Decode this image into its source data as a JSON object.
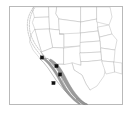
{
  "figure": {
    "name": "species-distribution-map",
    "title": "",
    "caption": "",
    "region_description": "Western United States and Baja California peninsula",
    "background_color": "#ffffff",
    "frame": {
      "visible": true,
      "color": "#b9b9b9",
      "x": 9,
      "y": 6,
      "width": 114,
      "height": 99
    }
  },
  "legend": {
    "visible": false,
    "entries": [
      {
        "label": "Shaded range",
        "swatch_color": "#9a9a9a",
        "symbol": "filled-band"
      },
      {
        "label": "Locality record",
        "swatch_color": "#111111",
        "symbol": "filled-dot"
      }
    ]
  },
  "map_layers": {
    "state_boundaries": {
      "name": "state-boundaries",
      "stroke_color": "#b3b3b3",
      "fill_color": "#ffffff",
      "visible": true
    },
    "coastline": {
      "name": "coastline",
      "stroke_color": "#8e8e8e",
      "visible": true
    },
    "offshore_dashed_line": {
      "name": "offshore-dashed-boundary",
      "stroke_color": "#a8a8a8",
      "style": "dashed",
      "visible": true
    },
    "range_band": {
      "name": "shaded-range-band",
      "fill_color": "#9a9a9a",
      "stroke_color": "#7d7d7d",
      "description": "Coastal band from southern California south along both coasts of the Baja California peninsula",
      "visible": true
    }
  },
  "chart_data": {
    "type": "scatter",
    "title": "",
    "xlabel": "",
    "ylabel": "",
    "projection": "equirectangular",
    "xlim": [
      -127,
      -88
    ],
    "ylim": [
      21,
      50
    ],
    "grid": false,
    "legend_position": "none",
    "series": [
      {
        "name": "locality-records",
        "marker": "square",
        "color": "#111111",
        "points": [
          {
            "id": 1,
            "x": 42.0,
            "y": 57.5,
            "label": ""
          },
          {
            "id": 2,
            "x": 56.5,
            "y": 66.0,
            "label": ""
          },
          {
            "id": 3,
            "x": 60.0,
            "y": 74.5,
            "label": ""
          },
          {
            "id": 4,
            "x": 53.5,
            "y": 83.0,
            "label": ""
          }
        ]
      }
    ],
    "point_count": 4
  }
}
